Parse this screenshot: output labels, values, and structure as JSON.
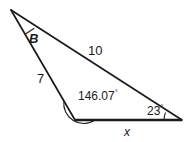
{
  "figure": {
    "type": "triangle-diagram",
    "background_color": "#ffffff",
    "stroke_color": "#1a1a1a",
    "labels": {
      "angle_apex": "B",
      "side_upper_right": "10",
      "side_left": "7",
      "angle_bottom_left": "146.07",
      "angle_bottom_right": "23",
      "side_base": "x",
      "degree_symbol": "°"
    },
    "geometry": {
      "vertex_apex": [
        11,
        10
      ],
      "vertex_bottom_left": [
        75,
        120
      ],
      "vertex_bottom_right": [
        182,
        120
      ],
      "base_stroke_width": 2.6,
      "side_stroke_width": 1.7,
      "arc_stroke_width": 1.1
    },
    "measures": {
      "angle_apex_label": "B",
      "angle_bottom_left_degrees": 146.07,
      "angle_bottom_right_degrees": 23,
      "side_left_length": 7,
      "side_upper_right_length": 10,
      "side_base_label": "x"
    }
  }
}
